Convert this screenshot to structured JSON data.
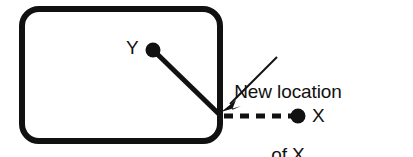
{
  "figure": {
    "background_color": "#ffffff",
    "stroke_color": "#111111",
    "labels": {
      "y_point": "Y",
      "x_point": "X",
      "annotation_line_1": "New location",
      "annotation_line_2": "of X"
    },
    "shapes": {
      "boundary": {
        "kind": "rounded-rectangle",
        "x": 22,
        "y": 9,
        "width": 198,
        "height": 132,
        "corner_radius": 17,
        "stroke_width": 6,
        "fill": "none"
      },
      "connector_line": {
        "kind": "solid-line",
        "from": [
          153,
          50
        ],
        "to": [
          221,
          116
        ],
        "stroke_width": 5
      },
      "dashed_line": {
        "kind": "dashed-line",
        "from": [
          224,
          116
        ],
        "to": [
          296,
          116
        ],
        "stroke_width": 5,
        "dash_pattern": "9 7",
        "dash_count": 4
      },
      "leader_arrow": {
        "kind": "arrow",
        "from": [
          277,
          57
        ],
        "to": [
          224,
          110
        ],
        "stroke_width": 2,
        "arrowhead": "solid-triangle"
      },
      "dot_y": {
        "kind": "filled-circle",
        "center": [
          153,
          50
        ],
        "radius": 7
      },
      "dot_x": {
        "kind": "filled-circle",
        "center": [
          298,
          116
        ],
        "radius": 7
      }
    }
  }
}
